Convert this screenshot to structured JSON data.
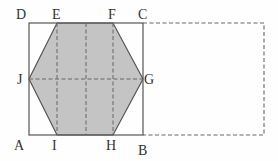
{
  "diagram": {
    "type": "geometry-folding",
    "colors": {
      "shade": "#c4c4c4",
      "line": "#555555",
      "dash": "#666666"
    },
    "labels": {
      "A": "A",
      "B": "B",
      "C": "C",
      "D": "D",
      "E": "E",
      "F": "F",
      "G": "G",
      "H": "H",
      "I": "I",
      "J": "J"
    }
  }
}
